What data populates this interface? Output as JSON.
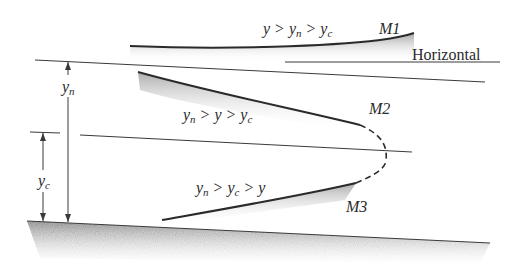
{
  "diagram": {
    "labels": {
      "m1_condition": {
        "parts": [
          "y",
          " > ",
          "y",
          "n",
          " > ",
          "y",
          "c"
        ]
      },
      "m1_name": "M1",
      "horizontal": "Horizontal",
      "m2_condition": {
        "parts": [
          "y",
          "n",
          " > ",
          "y",
          " > ",
          "y",
          "c"
        ]
      },
      "m2_name": "M2",
      "m3_condition": {
        "parts": [
          "y",
          "n",
          " > ",
          "y",
          "c",
          " > ",
          "y"
        ]
      },
      "m3_name": "M3",
      "yn_label": {
        "base": "y",
        "sub": "n"
      },
      "yc_label": {
        "base": "y",
        "sub": "c"
      }
    },
    "colors": {
      "line": "#3a3a3a",
      "shade": "#9a9a9a",
      "background": "#ffffff"
    }
  }
}
